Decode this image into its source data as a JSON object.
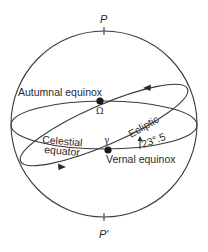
{
  "diagram": {
    "poles": {
      "north_label": "P",
      "south_label": "P′"
    },
    "points": {
      "autumnal": {
        "label": "Autumnal equinox",
        "symbol": "Ω"
      },
      "vernal": {
        "label": "Vernal equinox",
        "symbol": "γ"
      }
    },
    "circles": {
      "celestial_equator_line1": "Celestial",
      "celestial_equator_line2": "equator",
      "ecliptic": "Ecliptic"
    },
    "obliquity": {
      "label": "23°.5",
      "value_degrees": 23.5
    },
    "colors": {
      "line": "#3a3a3a",
      "text": "#2a2a2a",
      "background": "#ffffff"
    }
  }
}
